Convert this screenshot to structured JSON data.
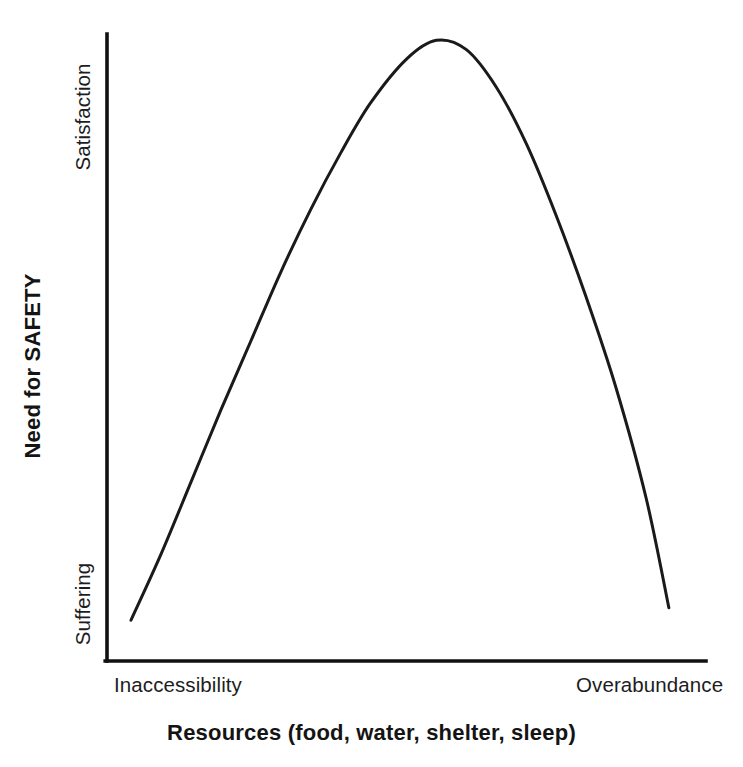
{
  "chart_data": {
    "type": "line",
    "title": "",
    "subtitle": "",
    "xlabel": "Resources (food, water, shelter, sleep)",
    "ylabel": "Need for SAFETY",
    "xticklabels": [
      "Inaccessibility",
      "Overabundance"
    ],
    "yticklabels": [
      "Suffering",
      "Satisfaction"
    ],
    "xlim": [
      0,
      1
    ],
    "ylim": [
      0,
      1
    ],
    "grid": false,
    "legend": null,
    "annotations": [],
    "series": [
      {
        "name": "Need for SAFETY",
        "shape": "inverted-u",
        "color": "#1a1a1a",
        "linewidth": 3,
        "x": [
          0.04,
          0.09,
          0.14,
          0.19,
          0.24,
          0.29,
          0.34,
          0.39,
          0.44,
          0.5,
          0.55,
          0.6,
          0.65,
          0.7,
          0.75,
          0.8,
          0.85,
          0.9,
          0.938
        ],
        "y": [
          0.065,
          0.17,
          0.285,
          0.4,
          0.51,
          0.62,
          0.72,
          0.81,
          0.89,
          0.96,
          0.99,
          0.975,
          0.915,
          0.825,
          0.71,
          0.58,
          0.435,
          0.26,
          0.085
        ]
      }
    ]
  },
  "axes": {
    "y_tick_top": "Satisfaction",
    "y_tick_bottom": "Suffering",
    "y_title": "Need for SAFETY",
    "x_tick_left": "Inaccessibility",
    "x_tick_right": "Overabundance",
    "x_title": "Resources (food, water, shelter, sleep)"
  },
  "style": {
    "line_color": "#1a1a1a",
    "axis_color": "#111111",
    "background": "#ffffff",
    "text_color": "#1d1d1d"
  }
}
